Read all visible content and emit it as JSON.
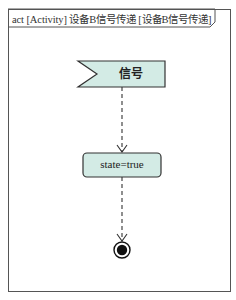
{
  "frame": {
    "title": "act [Activity] 设备B信号传递 [设备B信号传递]"
  },
  "nodes": {
    "signal": {
      "type": "accept-event",
      "label": "信号"
    },
    "action": {
      "type": "action",
      "label": "state=true"
    },
    "final": {
      "type": "activity-final"
    }
  },
  "edges": [
    {
      "from": "signal",
      "to": "action",
      "style": "dashed"
    },
    {
      "from": "action",
      "to": "final",
      "style": "dashed"
    }
  ],
  "colors": {
    "node_fill": "#d3ebe5",
    "stroke": "#333333",
    "frame_stroke": "#555555"
  }
}
